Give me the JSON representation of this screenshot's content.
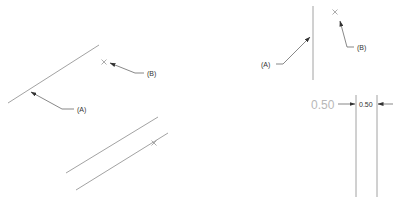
{
  "left_figure": {
    "label_a": "(A)",
    "label_b": "(B)",
    "line_a": {
      "x1": 8,
      "y1": 103,
      "x2": 99,
      "y2": 45
    },
    "point_b": {
      "x": 104,
      "y": 62
    },
    "parallel_lines": [
      {
        "x1": 66,
        "y1": 173,
        "x2": 158,
        "y2": 117
      },
      {
        "x1": 76,
        "y1": 190,
        "x2": 168,
        "y2": 133
      }
    ],
    "point_on_line": {
      "x": 154,
      "y": 143
    }
  },
  "right_figure": {
    "label_a": "(A)",
    "label_b": "(B)",
    "vertical_line": {
      "x": 313,
      "y1": 6,
      "y2": 80
    },
    "point_b": {
      "x": 335,
      "y": 12
    },
    "dimension": {
      "value_large": "0.50",
      "value_small": "0.50",
      "line1_x": 356,
      "line2_x": 377,
      "y1": 95,
      "y2": 197
    }
  },
  "colors": {
    "geometry": "#8a8a8a",
    "leader": "#555555",
    "dim_text_large": "#b8b8b8",
    "text": "#333333"
  }
}
